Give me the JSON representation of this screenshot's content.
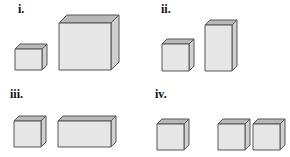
{
  "colors": {
    "front": "#e6e6e6",
    "top": "#b8b8b8",
    "side": "#cfcfcf",
    "edge": "#555555"
  },
  "panels": [
    {
      "label": "i.",
      "label_pos": [
        18,
        12
      ],
      "boxes": [
        {
          "x": 15,
          "y": 49,
          "w": 27,
          "h": 21,
          "d": 5
        },
        {
          "x": 59,
          "y": 23,
          "w": 52,
          "h": 47,
          "d": 8
        }
      ]
    },
    {
      "label": "ii.",
      "label_pos": [
        161,
        12
      ],
      "boxes": [
        {
          "x": 162,
          "y": 44,
          "w": 27,
          "h": 27,
          "d": 5
        },
        {
          "x": 205,
          "y": 25,
          "w": 27,
          "h": 46,
          "d": 5
        }
      ]
    },
    {
      "label": "iii.",
      "label_pos": [
        10,
        97
      ],
      "boxes": [
        {
          "x": 14,
          "y": 121,
          "w": 27,
          "h": 26,
          "d": 5
        },
        {
          "x": 58,
          "y": 121,
          "w": 53,
          "h": 26,
          "d": 5
        }
      ]
    },
    {
      "label": "iv.",
      "label_pos": [
        155,
        97
      ],
      "boxes": [
        {
          "x": 157,
          "y": 124,
          "w": 27,
          "h": 26,
          "d": 5
        },
        {
          "x": 218,
          "y": 124,
          "w": 27,
          "h": 26,
          "d": 5
        },
        {
          "x": 253,
          "y": 124,
          "w": 27,
          "h": 26,
          "d": 5
        }
      ]
    }
  ]
}
